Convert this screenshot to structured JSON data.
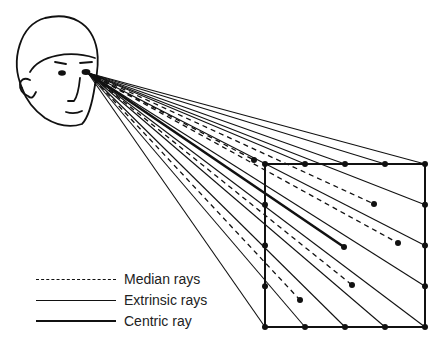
{
  "figure": {
    "elements": {
      "head": "head-drawing",
      "target": "square-grid"
    }
  },
  "legend": [
    {
      "style": "dashed",
      "label": "Median rays"
    },
    {
      "style": "solid",
      "label": "Extrinsic rays"
    },
    {
      "style": "thick",
      "label": "Centric ray"
    }
  ]
}
